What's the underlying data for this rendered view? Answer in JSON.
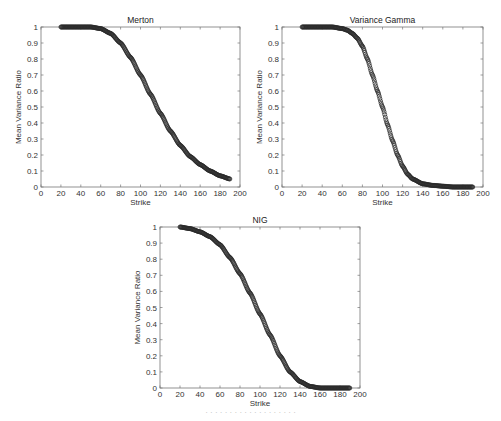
{
  "chart_data": [
    {
      "type": "scatter",
      "title": "Merton",
      "xlabel": "Strike",
      "ylabel": "Mean Variance Ratio",
      "xlim": [
        0,
        200
      ],
      "ylim": [
        0,
        1
      ],
      "xticks": [
        0,
        20,
        40,
        60,
        80,
        100,
        120,
        140,
        160,
        180,
        200
      ],
      "yticks": [
        0,
        0.1,
        0.2,
        0.3,
        0.4,
        0.5,
        0.6,
        0.7,
        0.8,
        0.9,
        1
      ],
      "grid": false,
      "series": [
        {
          "name": "Merton",
          "x": [
            20,
            30,
            40,
            50,
            60,
            70,
            80,
            90,
            100,
            110,
            120,
            130,
            140,
            150,
            160,
            170,
            180,
            190
          ],
          "y": [
            1.0,
            1.0,
            1.0,
            1.0,
            0.99,
            0.96,
            0.9,
            0.81,
            0.7,
            0.58,
            0.46,
            0.35,
            0.26,
            0.19,
            0.14,
            0.1,
            0.07,
            0.05
          ]
        }
      ]
    },
    {
      "type": "scatter",
      "title": "Variance Gamma",
      "xlabel": "Strike",
      "ylabel": "Mean Variance Ratio",
      "xlim": [
        0,
        200
      ],
      "ylim": [
        0,
        1
      ],
      "xticks": [
        0,
        20,
        40,
        60,
        80,
        100,
        120,
        140,
        160,
        180,
        200
      ],
      "yticks": [
        0,
        0.1,
        0.2,
        0.3,
        0.4,
        0.5,
        0.6,
        0.7,
        0.8,
        0.9,
        1
      ],
      "grid": false,
      "series": [
        {
          "name": "Variance Gamma",
          "x": [
            20,
            30,
            40,
            50,
            60,
            65,
            70,
            75,
            80,
            85,
            90,
            95,
            100,
            105,
            110,
            115,
            120,
            125,
            130,
            140,
            150,
            160,
            170,
            180,
            190
          ],
          "y": [
            1.0,
            1.0,
            1.0,
            1.0,
            0.99,
            0.98,
            0.96,
            0.93,
            0.88,
            0.8,
            0.7,
            0.6,
            0.5,
            0.39,
            0.29,
            0.2,
            0.13,
            0.08,
            0.05,
            0.02,
            0.01,
            0.005,
            0.0,
            0.0,
            0.0
          ]
        }
      ]
    },
    {
      "type": "scatter",
      "title": "NIG",
      "xlabel": "Strike",
      "ylabel": "Mean Variance Ratio",
      "xlim": [
        0,
        200
      ],
      "ylim": [
        0,
        1
      ],
      "xticks": [
        0,
        20,
        40,
        60,
        80,
        100,
        120,
        140,
        160,
        180,
        200
      ],
      "yticks": [
        0,
        0.1,
        0.2,
        0.3,
        0.4,
        0.5,
        0.6,
        0.7,
        0.8,
        0.9,
        1
      ],
      "grid": false,
      "series": [
        {
          "name": "NIG",
          "x": [
            20,
            30,
            40,
            50,
            60,
            70,
            80,
            90,
            100,
            110,
            120,
            130,
            140,
            150,
            160,
            170,
            180,
            190
          ],
          "y": [
            1.0,
            0.99,
            0.97,
            0.94,
            0.89,
            0.81,
            0.71,
            0.59,
            0.46,
            0.33,
            0.2,
            0.1,
            0.04,
            0.01,
            0.0,
            0.0,
            0.0,
            0.0
          ]
        }
      ]
    }
  ],
  "layout": {
    "panels": [
      {
        "left": 41,
        "top": 27,
        "width": 199,
        "height": 160
      },
      {
        "left": 282,
        "top": 27,
        "width": 201,
        "height": 160
      },
      {
        "left": 160,
        "top": 227,
        "width": 200,
        "height": 161
      }
    ],
    "marker_color": "#2a2a2a"
  },
  "caption": "· · · · · · · · · · · · · · · · · · ·"
}
